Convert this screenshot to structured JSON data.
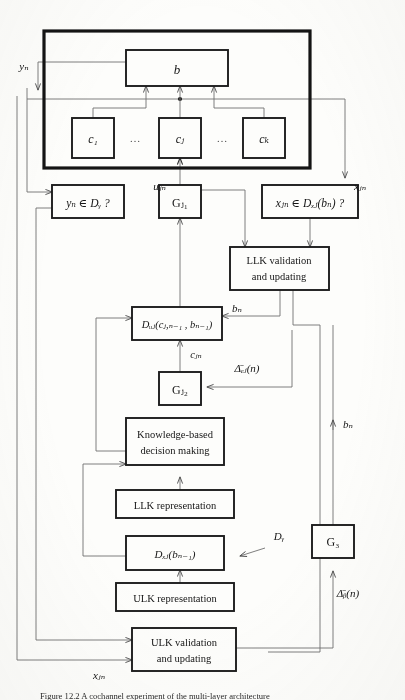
{
  "figure": {
    "caption": "Figure 12.2  A cochannel experiment of the multi-layer architecture",
    "outer_block": {
      "name": "outer-system-block"
    },
    "boxes": {
      "b": "b",
      "c1": "c₁",
      "cj": "cⱼ",
      "ck": "cₖ",
      "ellipsis_left": "…",
      "ellipsis_right": "…",
      "yn_test": "yₙ ∈ Dᵧ ?",
      "gj1": "Gⱼ₁",
      "xjn_test": "xⱼₙ ∈ Dₓⱼ(bₙ) ?",
      "llk_validation_line1": "LLK validation",
      "llk_validation_line2": "and updating",
      "duj": "Dᵤⱼ(cⱼ,ₙ₋₁ , bₙ₋₁)",
      "gj2": "Gⱼ₂",
      "kbdm_line1": "Knowledge-based",
      "kbdm_line2": "decision making",
      "llk_representation": "LLK representation",
      "dxj": "Dₓⱼ(bₙ₋₁)",
      "ulk_representation": "ULK representation",
      "ulk_validation_line1": "ULK validation",
      "ulk_validation_line2": "and updating",
      "g3": "G₃"
    },
    "edge_labels": {
      "yn": "yₙ",
      "ujn": "uⱼₙ",
      "xjn_top": "xⱼₙ",
      "bn_mid": "bₙ",
      "cjn": "cⱼₙ",
      "delta_cj": "Δ̄ₑⱼ(n)",
      "bn_right": "bₙ",
      "dy": "Dᵧ",
      "delta_b": "Δ̄ᵦ(n)",
      "xjn_bottom": "xⱼₙ"
    },
    "colors": {
      "ink": "#1a1a1a",
      "thin_line": "#6b6b6b",
      "paper": "#fdfdfb"
    }
  }
}
